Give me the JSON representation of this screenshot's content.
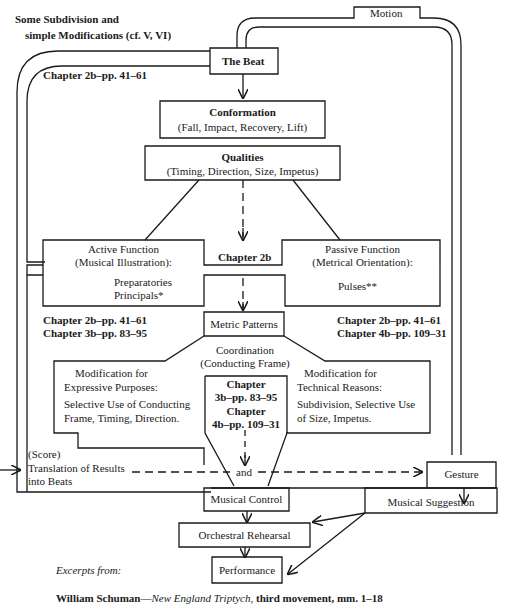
{
  "diagram": {
    "top_note": {
      "line1": "Some Subdivision and",
      "line2": "simple Modifications (cf. V, VI)"
    },
    "motion": "Motion",
    "the_beat": "The Beat",
    "ref_beat": "Chapter 2b–pp. 41–61",
    "conformation": {
      "title": "Conformation",
      "sub": "(Fall, Impact, Recovery, Lift)"
    },
    "qualities": {
      "title": "Qualities",
      "sub": "(Timing, Direction, Size, Impetus)"
    },
    "center_ref": "Chapter 2b",
    "active_function": {
      "line1": "Active Function",
      "line2": "(Musical Illustration):",
      "item1": "Preparatories",
      "item2": "Principals*"
    },
    "passive_function": {
      "line1": "Passive Function",
      "line2": "(Metrical Orientation):",
      "item1": "Pulses**"
    },
    "refs_left": {
      "line1": "Chapter 2b–pp. 41–61",
      "line2": "Chapter 3b–pp. 83–95"
    },
    "refs_right": {
      "line1": "Chapter 2b–pp. 41–61",
      "line2": "Chapter 4b–pp. 109–31"
    },
    "metric_patterns": "Metric Patterns",
    "coordination": {
      "line1": "Coordination",
      "line2": "(Conducting Frame)"
    },
    "center_chapters": {
      "l1": "Chapter",
      "l2": "3b–pp. 83–95",
      "l3": "Chapter",
      "l4": "4b–pp. 109–31"
    },
    "mod_expressive": {
      "l1": "Modification for",
      "l2": "Expressive Purposes:",
      "l3": "Selective Use of Conducting",
      "l4": "Frame, Timing,  Direction."
    },
    "mod_technical": {
      "l1": "Modification for",
      "l2": "Technical Reasons:",
      "l3": "Subdivision,  Selective Use",
      "l4": "of Size,   Impetus."
    },
    "score": {
      "l1": "(Score)",
      "l2": "Translation of Results",
      "l3": "into Beats"
    },
    "and": "and",
    "gesture": "Gesture",
    "musical_control": "Musical Control",
    "musical_suggestion": "Musical Suggestion",
    "orchestral_rehearsal": "Orchestral Rehearsal",
    "performance": "Performance"
  },
  "footer": {
    "excerpts": "Excerpts from:",
    "composer": "William Schuman—",
    "work": "New England Triptych,",
    "rest": " third movement, mm. 1–18"
  }
}
